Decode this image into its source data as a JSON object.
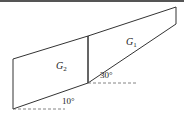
{
  "diagram": {
    "regions": [
      {
        "id": "G1",
        "label": "G",
        "subscript": "1"
      },
      {
        "id": "G2",
        "label": "G",
        "subscript": "2"
      }
    ],
    "angles": [
      {
        "label": "30°",
        "value": 30
      },
      {
        "label": "10°",
        "value": 10
      }
    ],
    "colors": {
      "stroke": "#333333",
      "dash": "#666666",
      "topbar": "#555555"
    }
  }
}
